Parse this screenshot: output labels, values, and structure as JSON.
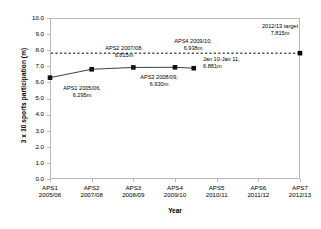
{
  "chart_data": {
    "type": "line",
    "title": "",
    "xlabel": "Year",
    "ylabel": "3 x 30 sports participation (m)",
    "ylim": [
      0.0,
      10.0
    ],
    "ytick_labels": [
      "0.0",
      "1.0",
      "2.0",
      "3.0",
      "4.0",
      "5.0",
      "6.0",
      "7.0",
      "8.0",
      "9.0",
      "10.0"
    ],
    "ytick_values": [
      0.0,
      1.0,
      2.0,
      3.0,
      4.0,
      5.0,
      6.0,
      7.0,
      8.0,
      9.0,
      10.0
    ],
    "grid": false,
    "legend": "none",
    "categories": [
      "APS1 2005/06",
      "APS2 2007/08",
      "APS3 2008/09",
      "APS4 2009/10",
      "APS5 2010/11",
      "APS6 2011/12",
      "APS7 2012/13"
    ],
    "xtick_labels": [
      {
        "line1": "APS1",
        "line2": "2005/06"
      },
      {
        "line1": "APS2",
        "line2": "2007/08"
      },
      {
        "line1": "APS3",
        "line2": "2008/09"
      },
      {
        "line1": "APS4",
        "line2": "2009/10"
      },
      {
        "line1": "APS5",
        "line2": "2010/11"
      },
      {
        "line1": "APS6",
        "line2": "2011/12"
      },
      {
        "line1": "APS7",
        "line2": "2012/13"
      }
    ],
    "series": [
      {
        "name": "3 x 30 sports participation",
        "style": "solid-line-square-markers",
        "color": "#3f3f3f",
        "points": [
          {
            "x_index": 0,
            "value": 6.295,
            "label_line1": "APS1 2005/06,",
            "label_line2": "6.295m"
          },
          {
            "x_index": 1,
            "value": 6.815,
            "label_line1": "APS2 2007/08,",
            "label_line2": "6.815m"
          },
          {
            "x_index": 2,
            "value": 6.93,
            "label_line1": "APS3 2008/09,",
            "label_line2": "6.930m"
          },
          {
            "x_index": 3,
            "value": 6.938,
            "label_line1": "APS4 2009/10,",
            "label_line2": "6.938m"
          },
          {
            "x_index": 3.45,
            "value": 6.881,
            "label_line1": "Jan 10-Jan 11,",
            "label_line2": "6.881m"
          }
        ]
      },
      {
        "name": "2012/13 target",
        "style": "dashed-line-square-marker",
        "color": "#000000",
        "value": 7.815,
        "label_line1": "2012/13 target",
        "label_line2": "7.815m",
        "marker_x_index": 6
      }
    ]
  },
  "axis": {
    "y_title": "3 x 30 sports participation (m)",
    "x_title": "Year"
  },
  "labels": {
    "aps1": {
      "l1": "APS1 2005/06,",
      "l2": "6.295m"
    },
    "aps2": {
      "l1": "APS2 2007/08,",
      "l2": "6.815m"
    },
    "aps3": {
      "l1": "APS3 2008/09,",
      "l2": "6.930m"
    },
    "aps4": {
      "l1": "APS4 2009/10,",
      "l2": "6.938m"
    },
    "jan": {
      "l1": "Jan 10-Jan 11,",
      "l2": "6.881m"
    },
    "target": {
      "l1": "2012/13 target",
      "l2": "7.815m"
    }
  },
  "colors": {
    "frame": "#b9b9b9",
    "series": "#3f3f3f",
    "target": "#000000",
    "text": "#000000"
  }
}
